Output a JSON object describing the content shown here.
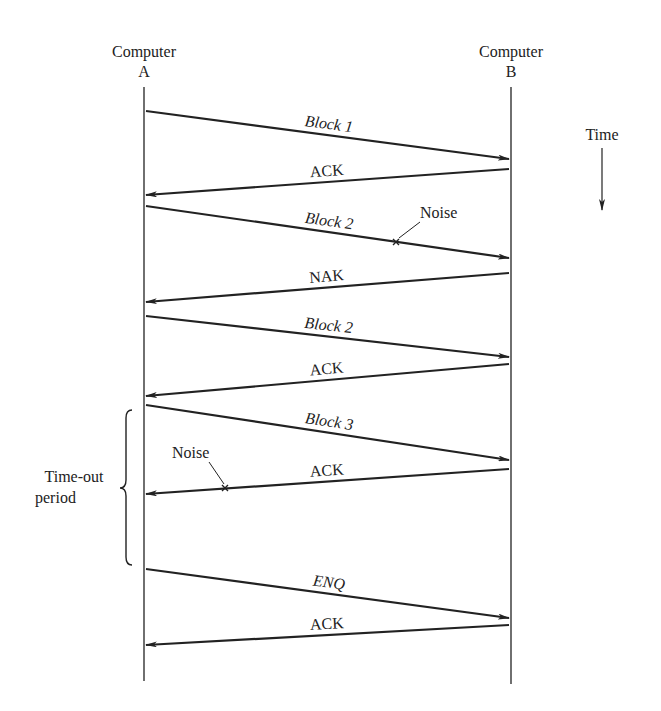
{
  "figure": {
    "ink_color": "#222222",
    "background": "#ffffff"
  },
  "nodes": [
    {
      "id": "A",
      "line1": "Computer",
      "line2": "A",
      "x": 144,
      "y_top": 87,
      "y_bottom": 681
    },
    {
      "id": "B",
      "line1": "Computer",
      "line2": "B",
      "x": 511,
      "y_top": 87,
      "y_bottom": 684
    }
  ],
  "time_axis": {
    "label": "Time",
    "x": 602,
    "label_y": 140,
    "y_start": 148,
    "y_end": 210
  },
  "messages": [
    {
      "label": "Block 1",
      "italic": true,
      "from": "A",
      "to": "B",
      "y_from": 111,
      "y_to": 159
    },
    {
      "label": "ACK",
      "italic": false,
      "from": "B",
      "to": "A",
      "y_from": 169,
      "y_to": 195
    },
    {
      "label": "Block 2",
      "italic": true,
      "from": "A",
      "to": "B",
      "y_from": 206,
      "y_to": 258,
      "noise": {
        "label": "Noise",
        "x": 396,
        "y": 242,
        "label_x": 420,
        "label_y": 218,
        "leader_to": [
          420,
          222
        ]
      }
    },
    {
      "label": "NAK",
      "italic": false,
      "from": "B",
      "to": "A",
      "y_from": 273,
      "y_to": 302
    },
    {
      "label": "Block 2",
      "italic": true,
      "from": "A",
      "to": "B",
      "y_from": 316,
      "y_to": 357
    },
    {
      "label": "ACK",
      "italic": false,
      "from": "B",
      "to": "A",
      "y_from": 364,
      "y_to": 396
    },
    {
      "label": "Block 3",
      "italic": true,
      "from": "A",
      "to": "B",
      "y_from": 405,
      "y_to": 460
    },
    {
      "label": "ACK",
      "italic": false,
      "from": "B",
      "to": "A",
      "y_from": 469,
      "y_to": 494,
      "noise": {
        "label": "Noise",
        "x": 225,
        "y": 488,
        "label_x": 172,
        "label_y": 458,
        "leader_to": [
          209,
          462
        ]
      }
    },
    {
      "label": "ENQ",
      "italic": true,
      "from": "A",
      "to": "B",
      "y_from": 569,
      "y_to": 618
    },
    {
      "label": "ACK",
      "italic": false,
      "from": "B",
      "to": "A",
      "y_from": 625,
      "y_to": 645
    }
  ],
  "timeout_brace": {
    "line1": "Time-out",
    "line2": "period",
    "x": 126,
    "y_top": 410,
    "y_bottom": 565,
    "text_x": 74,
    "text_y1": 482,
    "text_y2": 503
  }
}
